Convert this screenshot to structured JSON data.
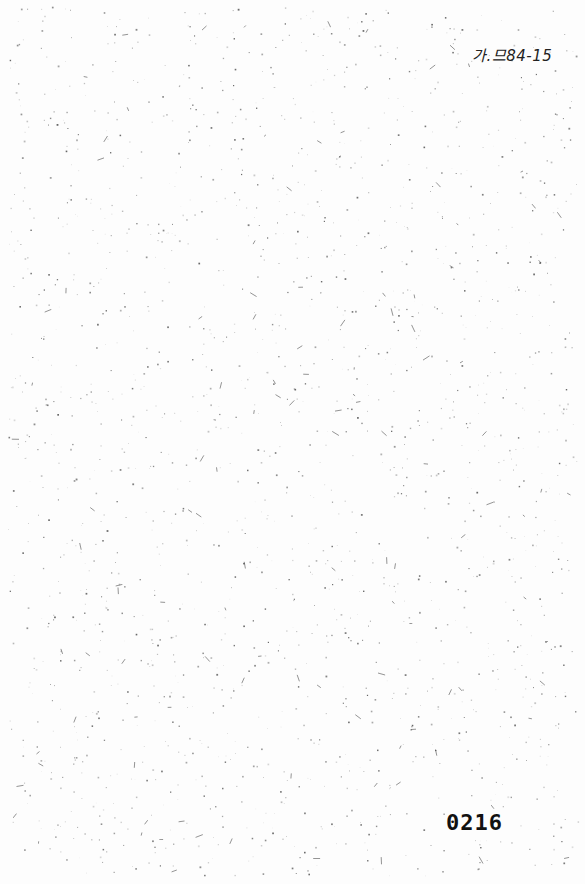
{
  "document": {
    "reference_mark": "가.므84-15",
    "page_number": "0216",
    "body_text": ""
  }
}
